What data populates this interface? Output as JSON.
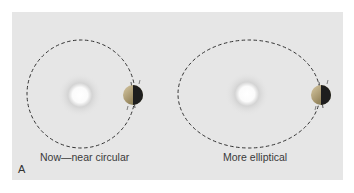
{
  "figure": {
    "panel_letter": "A",
    "panels": [
      {
        "caption": "Now—near circular",
        "orbit": {
          "shape": "circle",
          "cx": 81,
          "cy": 94,
          "rx": 54,
          "ry": 54
        },
        "sun": {
          "cx": 80,
          "cy": 95
        },
        "earth": {
          "cx": 133,
          "cy": 95
        }
      },
      {
        "caption": "More elliptical",
        "orbit": {
          "shape": "ellipse",
          "cx": 249,
          "cy": 94,
          "rx": 71,
          "ry": 54
        },
        "sun": {
          "cx": 247,
          "cy": 94
        },
        "earth": {
          "cx": 321,
          "cy": 95
        }
      }
    ],
    "colors": {
      "background": "#e6e6e6",
      "orbit_line": "#333333",
      "earth_lit": "#b8a27a",
      "earth_dark": "#1e1e1e"
    }
  }
}
